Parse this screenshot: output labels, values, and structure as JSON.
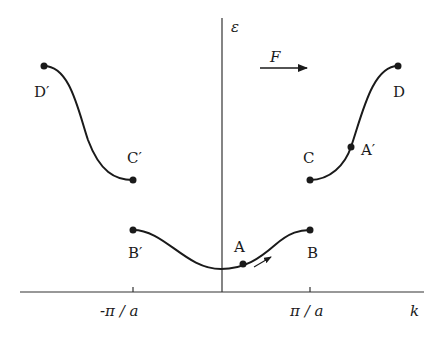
{
  "diagram": {
    "axes": {
      "y_label": "ε",
      "x_label": "k",
      "x_ticks": [
        "-π / a",
        "π / a"
      ]
    },
    "force_label": "F",
    "points": {
      "A": "A",
      "B": "B",
      "B_prime": "B′",
      "C": "C",
      "C_prime": "C′",
      "D": "D",
      "D_prime": "D′",
      "A_prime": "A′"
    },
    "colors": {
      "ink": "#1a1a1a",
      "background": "#ffffff"
    }
  }
}
